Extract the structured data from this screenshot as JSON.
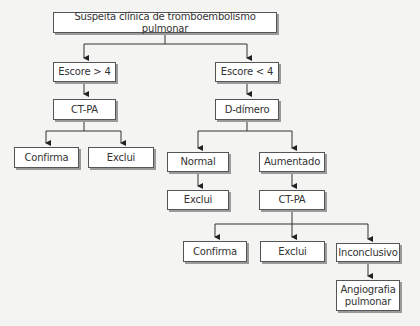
{
  "diagram": {
    "title": "Suspeita clínica de tromboembolismo pulmonar",
    "nodes": {
      "root": "Suspeita clínica de tromboembolismo pulmonar",
      "escore_high": "Escore > 4",
      "escore_low": "Escore < 4",
      "ctpa_left": "CT-PA",
      "ddimero": "D-dímero",
      "confirma_left": "Confirma",
      "exclui_left": "Exclui",
      "normal": "Normal",
      "aumentado": "Aumentado",
      "exclui_normal": "Exclui",
      "ctpa_right": "CT-PA",
      "confirma_right": "Confirma",
      "exclui_right": "Exclui",
      "inconclusivo": "Inconclusivo",
      "angiografia": "Angiografia pulmonar"
    },
    "edges": [
      [
        "root",
        "escore_high"
      ],
      [
        "root",
        "escore_low"
      ],
      [
        "escore_high",
        "ctpa_left"
      ],
      [
        "escore_low",
        "ddimero"
      ],
      [
        "ctpa_left",
        "confirma_left"
      ],
      [
        "ctpa_left",
        "exclui_left"
      ],
      [
        "ddimero",
        "normal"
      ],
      [
        "ddimero",
        "aumentado"
      ],
      [
        "normal",
        "exclui_normal"
      ],
      [
        "aumentado",
        "ctpa_right"
      ],
      [
        "ctpa_right",
        "confirma_right"
      ],
      [
        "ctpa_right",
        "exclui_right"
      ],
      [
        "ctpa_right",
        "inconclusivo"
      ],
      [
        "inconclusivo",
        "angiografia"
      ]
    ]
  }
}
